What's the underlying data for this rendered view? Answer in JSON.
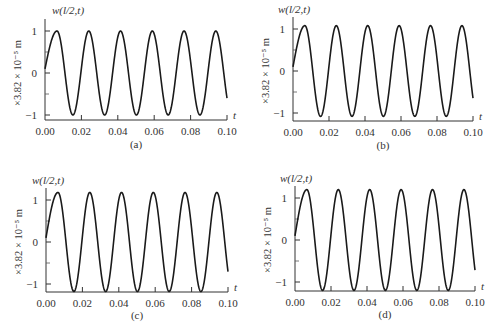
{
  "chart_data": [
    {
      "type": "line",
      "panel": "(a)",
      "title": "w(l/2,t)",
      "xlabel": "t",
      "ylabel": "×3.82 × 10⁻⁵ m",
      "xticks": [
        "0.00",
        "0.02",
        "0.04",
        "0.06",
        "0.08",
        "0.10"
      ],
      "yticks": [
        "1",
        "0",
        "-1"
      ],
      "xlim": [
        0,
        0.1
      ],
      "ylim": [
        -1.08,
        1.08
      ],
      "grid": false,
      "series": [
        {
          "name": "w(l/2,t)",
          "amplitude": 1.0,
          "frequency_hz": 57.3,
          "phase": 0.1,
          "x": [
            0.0,
            0.0066,
            0.0153,
            0.024,
            0.0327,
            0.0415,
            0.0502,
            0.0589,
            0.0677,
            0.0764,
            0.0851,
            0.0938,
            0.1
          ],
          "values": [
            0.1,
            1.0,
            -1.0,
            1.0,
            -1.0,
            1.0,
            -1.0,
            1.0,
            -1.0,
            1.0,
            -1.0,
            1.0,
            -0.5
          ]
        }
      ],
      "geom": {
        "left": 45,
        "right": 227,
        "top": 31,
        "zero": 73,
        "bottom": 115,
        "axis_y": 120,
        "caption_y": 148,
        "title_x": 52,
        "title_y": 14
      }
    },
    {
      "type": "line",
      "panel": "(b)",
      "title": "w(l/2,t)",
      "xlabel": "t",
      "ylabel": "×3.82 × 10⁻⁵ m",
      "xticks": [
        "0.00",
        "0.02",
        "0.04",
        "0.06",
        "0.08",
        "0.10"
      ],
      "yticks": [
        "1",
        "0",
        "-1"
      ],
      "xlim": [
        0,
        0.1
      ],
      "ylim": [
        -1.15,
        1.15
      ],
      "grid": false,
      "series": [
        {
          "name": "w(l/2,t)",
          "amplitude": 1.08,
          "frequency_hz": 57.3,
          "phase": 0.1,
          "x": [
            0.0,
            0.0066,
            0.0153,
            0.024,
            0.0327,
            0.0415,
            0.0502,
            0.0589,
            0.0677,
            0.0764,
            0.0851,
            0.0938,
            0.1
          ],
          "values": [
            0.1,
            1.08,
            -1.08,
            1.08,
            -1.08,
            1.08,
            -1.08,
            1.08,
            -1.08,
            1.08,
            -1.08,
            1.08,
            -0.5
          ]
        }
      ],
      "geom": {
        "left": 293,
        "right": 473,
        "top": 29,
        "zero": 71,
        "bottom": 114,
        "axis_y": 121,
        "caption_y": 149,
        "title_x": 278,
        "title_y": 13
      }
    },
    {
      "type": "line",
      "panel": "(c)",
      "title": "w(l/2,t)",
      "xlabel": "t",
      "ylabel": "×3.82 × 10⁻⁵ m",
      "xticks": [
        "0.00",
        "0.02",
        "0.04",
        "0.06",
        "0.08",
        "0.10"
      ],
      "yticks": [
        "1",
        "0",
        "-1"
      ],
      "xlim": [
        0,
        0.1
      ],
      "ylim": [
        -1.2,
        1.2
      ],
      "grid": false,
      "series": [
        {
          "name": "w(l/2,t)",
          "amplitude": 1.18,
          "frequency_hz": 57.3,
          "phase": 0.1,
          "x": [
            0.0,
            0.0066,
            0.0153,
            0.024,
            0.0327,
            0.0415,
            0.0502,
            0.0589,
            0.0677,
            0.0764,
            0.0851,
            0.0938,
            0.1
          ],
          "values": [
            0.1,
            1.18,
            -1.18,
            1.18,
            -1.18,
            1.18,
            -1.18,
            1.18,
            -1.18,
            1.18,
            -1.18,
            1.18,
            -0.6
          ]
        }
      ],
      "geom": {
        "left": 46,
        "right": 228,
        "top": 200,
        "zero": 242,
        "bottom": 285,
        "axis_y": 292,
        "caption_y": 319,
        "title_x": 32,
        "title_y": 184
      }
    },
    {
      "type": "line",
      "panel": "(d)",
      "title": "w(l/2,t)",
      "xlabel": "t",
      "ylabel": "×3.82 × 10⁻⁵ m",
      "xticks": [
        "0.00",
        "0.02",
        "0.04",
        "0.06",
        "0.08",
        "0.10"
      ],
      "yticks": [
        "1",
        "0",
        "-1"
      ],
      "xlim": [
        0,
        0.1
      ],
      "ylim": [
        -1.22,
        1.22
      ],
      "grid": false,
      "series": [
        {
          "name": "w(l/2,t)",
          "amplitude": 1.2,
          "frequency_hz": 57.3,
          "phase": 0.1,
          "x": [
            0.0,
            0.0066,
            0.0153,
            0.024,
            0.0327,
            0.0415,
            0.0502,
            0.0589,
            0.0677,
            0.0764,
            0.0851,
            0.0938,
            0.1
          ],
          "values": [
            0.1,
            1.2,
            -1.2,
            1.2,
            -1.2,
            1.2,
            -1.2,
            1.2,
            -1.2,
            1.2,
            -1.2,
            1.2,
            -0.6
          ]
        }
      ],
      "geom": {
        "left": 295,
        "right": 475,
        "top": 198,
        "zero": 240,
        "bottom": 283,
        "axis_y": 291,
        "caption_y": 318,
        "title_x": 280,
        "title_y": 182
      }
    }
  ]
}
